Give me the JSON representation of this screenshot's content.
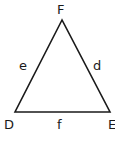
{
  "diagram": {
    "type": "triangle",
    "stroke_color": "#1a1a1a",
    "background": "#ffffff",
    "vertices": [
      {
        "label": "F",
        "x": 62,
        "y": 20,
        "label_x": 57,
        "label_y": 14
      },
      {
        "label": "D",
        "x": 15,
        "y": 112,
        "label_x": 4,
        "label_y": 129
      },
      {
        "label": "E",
        "x": 110,
        "y": 112,
        "label_x": 108,
        "label_y": 129
      }
    ],
    "sides": [
      {
        "label": "e",
        "between": [
          "D",
          "F"
        ],
        "label_x": 19,
        "label_y": 70
      },
      {
        "label": "d",
        "between": [
          "F",
          "E"
        ],
        "label_x": 93,
        "label_y": 70
      },
      {
        "label": "f",
        "between": [
          "D",
          "E"
        ],
        "label_x": 57,
        "label_y": 129
      }
    ]
  }
}
